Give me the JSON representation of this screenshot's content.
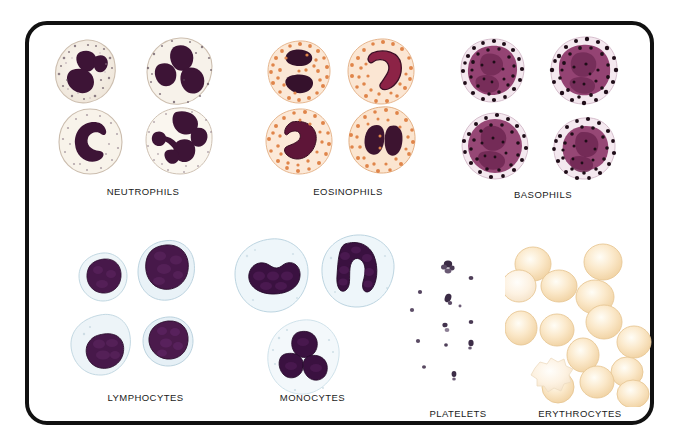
{
  "figure": {
    "kind": "blood-cell-identification-plate",
    "background_color": "#ffffff",
    "frame_color": "#111111",
    "frame_radius_px": 22
  },
  "panels": [
    {
      "id": "neutrophils",
      "label": "NEUTROPHILS",
      "cell_count": 4,
      "cytoplasm_color": "#f5efe6",
      "granule_color": "#b8a898",
      "nucleus_color": "#3d1436",
      "nucleus_shape": "multilobed",
      "membrane_color": "#cbbdb0"
    },
    {
      "id": "eosinophils",
      "label": "EOSINOPHILS",
      "cell_count": 4,
      "cytoplasm_color": "#fbe6d4",
      "granule_color": "#e08a4e",
      "nucleus_color": "#7e1f3f",
      "nucleus_shape": "bilobed",
      "membrane_color": "#e7b38b"
    },
    {
      "id": "basophils",
      "label": "BASOPHILS",
      "cell_count": 4,
      "cytoplasm_color": "#f6eef2",
      "granule_color": "#2a1220",
      "nucleus_color": "#8c3b6b",
      "nucleus_shape": "obscured",
      "membrane_color": "#d7bccb"
    },
    {
      "id": "lymphocytes",
      "label": "LYMPHOCYTES",
      "cell_count": 4,
      "cytoplasm_color": "#e8f0f4",
      "granule_color": "#cfe0e8",
      "nucleus_color": "#3b1136",
      "nucleus_shape": "round",
      "membrane_color": "#b9cfdb"
    },
    {
      "id": "monocytes",
      "label": "MONOCYTES",
      "cell_count": 3,
      "cytoplasm_color": "#e9f2f6",
      "granule_color": "#d4e4ec",
      "nucleus_color": "#36113a",
      "nucleus_shape": "kidney-bean",
      "membrane_color": "#bcd3df"
    },
    {
      "id": "platelets",
      "label": "PLATELETS",
      "cell_count": 13,
      "cytoplasm_color": "#6a5a72",
      "granule_color": "#2d1f35",
      "nucleus_color": "#2d1f35",
      "nucleus_shape": "fragment",
      "membrane_color": "#8d7f95"
    },
    {
      "id": "erythrocytes",
      "label": "ERYTHROCYTES",
      "cell_count": 15,
      "cytoplasm_color": "#fbe7c6",
      "granule_color": "#f7dcb0",
      "nucleus_color": "none",
      "nucleus_shape": "biconcave-disc",
      "membrane_color": "#e8c795"
    }
  ]
}
